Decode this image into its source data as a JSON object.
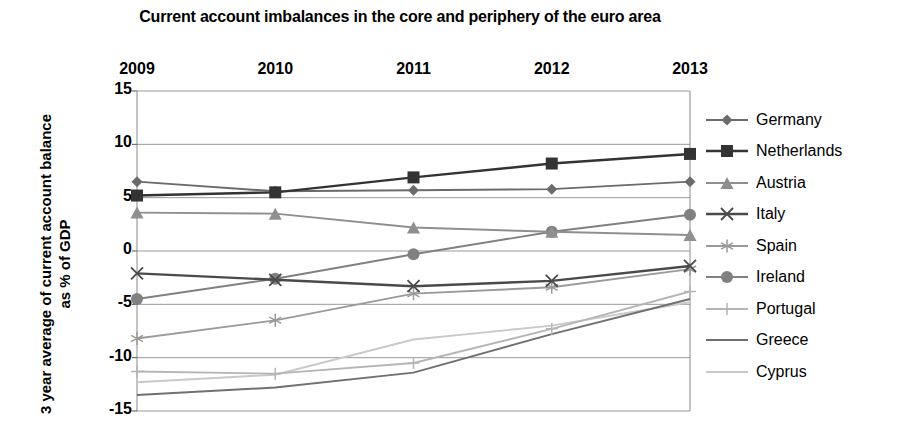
{
  "chart_data": {
    "type": "line",
    "title": "Current account imbalances in the core and periphery of the euro area",
    "xlabel": "",
    "ylabel": "3 year average of current account balance as % of GDP",
    "categories": [
      "2009",
      "2010",
      "2011",
      "2012",
      "2013"
    ],
    "ylim": [
      -15,
      15
    ],
    "yticks": [
      "15",
      "10",
      "5",
      "0",
      "-5",
      "-10",
      "-15"
    ],
    "ytick_values": [
      15,
      10,
      5,
      0,
      -5,
      -10,
      -15
    ],
    "grid": true,
    "xaxis_position": "top",
    "legend_position": "right",
    "series": [
      {
        "name": "Germany",
        "marker": "diamond",
        "color": "#6b6b6b",
        "values": [
          6.5,
          5.6,
          5.7,
          5.8,
          6.5
        ]
      },
      {
        "name": "Netherlands",
        "marker": "square",
        "color": "#333333",
        "values": [
          5.2,
          5.5,
          6.9,
          8.2,
          9.1
        ]
      },
      {
        "name": "Austria",
        "marker": "triangle",
        "color": "#8f8f8f",
        "values": [
          3.6,
          3.5,
          2.2,
          1.8,
          1.5
        ]
      },
      {
        "name": "Italy",
        "marker": "cross",
        "color": "#4a4a4a",
        "values": [
          -2.1,
          -2.7,
          -3.3,
          -2.8,
          -1.4
        ]
      },
      {
        "name": "Spain",
        "marker": "asterisk",
        "color": "#9a9a9a",
        "values": [
          -8.2,
          -6.5,
          -4.0,
          -3.4,
          -1.7
        ]
      },
      {
        "name": "Ireland",
        "marker": "circle",
        "color": "#808080",
        "values": [
          -4.5,
          -2.6,
          -0.3,
          1.8,
          3.4
        ]
      },
      {
        "name": "Portugal",
        "marker": "plus",
        "color": "#b5b5b5",
        "values": [
          -11.3,
          -11.5,
          -10.5,
          -7.3,
          -3.8
        ]
      },
      {
        "name": "Greece",
        "marker": "none",
        "color": "#707070",
        "values": [
          -13.5,
          -12.8,
          -11.4,
          -7.8,
          -4.5
        ]
      },
      {
        "name": "Cyprus",
        "marker": "none",
        "color": "#c9c9c9",
        "values": [
          -12.3,
          -11.6,
          -8.3,
          -7.0,
          -4.8
        ]
      }
    ]
  },
  "axis": {
    "grid_color": "#9a9a9a",
    "border_color": "#8a8a8a"
  }
}
